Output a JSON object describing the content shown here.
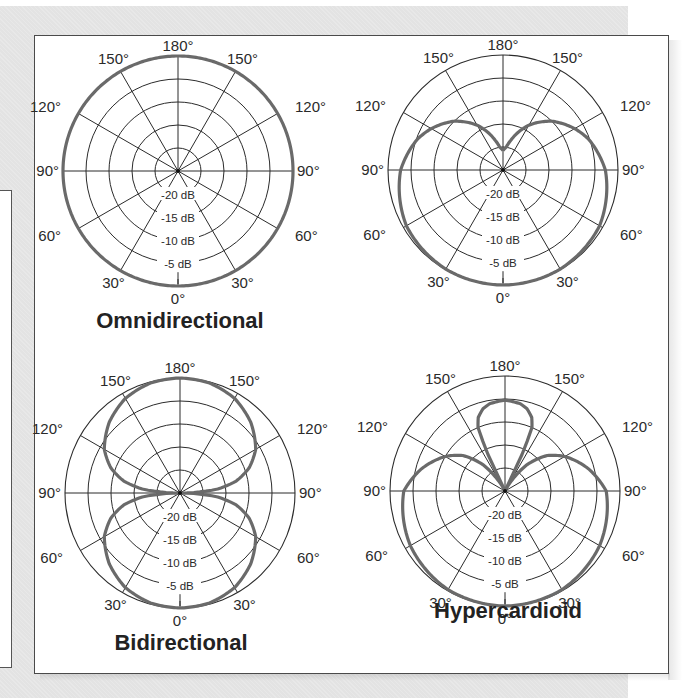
{
  "figure": {
    "plots": [
      {
        "id": "omni",
        "title": "Omnidirectional",
        "cx": 178,
        "cy": 171,
        "title_x": 180,
        "title_y": 328
      },
      {
        "id": "cardioid",
        "title": "",
        "cx": 503,
        "cy": 170,
        "title_x": 505,
        "title_y": 328
      },
      {
        "id": "bidirectional",
        "title": "Bidirectional",
        "cx": 180,
        "cy": 493,
        "title_x": 181,
        "title_y": 650
      },
      {
        "id": "hypercardioid",
        "title": "Hypercardioid",
        "cx": 505,
        "cy": 491,
        "title_x": 508,
        "title_y": 618
      }
    ],
    "radius": 115,
    "angle_labels": [
      "180°",
      "150°",
      "150°",
      "120°",
      "120°",
      "90°",
      "90°",
      "60°",
      "60°",
      "30°",
      "30°",
      "0°"
    ],
    "ring_labels": [
      "-20 dB",
      "-15 dB",
      "-10 dB",
      "-5 dB"
    ],
    "colors": {
      "grid": "#2b2b2b",
      "pattern": "#6a6a6a",
      "panel_border": "#4a4a4a",
      "background": "#e3e3e3"
    }
  },
  "chart_data": [
    {
      "type": "polar",
      "title": "Omnidirectional",
      "angle_unit": "degrees (0° = front/bottom, 180° = rear/top), symmetric left/right",
      "angles": [
        0,
        30,
        60,
        90,
        120,
        150,
        180
      ],
      "radial_ticks": [
        "-20 dB",
        "-15 dB",
        "-10 dB",
        "-5 dB",
        "0 dB"
      ],
      "values_db": [
        0,
        0,
        0,
        0,
        0,
        0,
        0
      ],
      "r_fraction": [
        [
          0,
          1.0
        ],
        [
          180,
          1.0
        ]
      ]
    },
    {
      "type": "polar",
      "title": "Cardioid",
      "angles": [
        0,
        30,
        60,
        90,
        120,
        150,
        180
      ],
      "radial_ticks": [
        "-20 dB",
        "-15 dB",
        "-10 dB",
        "-5 dB",
        "0 dB"
      ],
      "values_db": [
        0,
        0,
        -1,
        -2.5,
        -6,
        -12,
        -21
      ],
      "r_fraction": [
        [
          0,
          1.0
        ],
        [
          30,
          0.995
        ],
        [
          60,
          0.97
        ],
        [
          90,
          0.89
        ],
        [
          110,
          0.79
        ],
        [
          120,
          0.72
        ],
        [
          135,
          0.6
        ],
        [
          150,
          0.45
        ],
        [
          165,
          0.27
        ],
        [
          172,
          0.2
        ],
        [
          180,
          0.17
        ]
      ]
    },
    {
      "type": "polar",
      "title": "Bidirectional",
      "angles": [
        0,
        30,
        60,
        90,
        120,
        150,
        180
      ],
      "radial_ticks": [
        "-20 dB",
        "-15 dB",
        "-10 dB",
        "-5 dB",
        "0 dB"
      ],
      "values_db": [
        0,
        -1.2,
        -6,
        -25,
        -6,
        -1.2,
        0
      ],
      "r_fraction": [
        [
          0,
          1.0
        ],
        [
          15,
          0.99
        ],
        [
          30,
          0.95
        ],
        [
          45,
          0.87
        ],
        [
          60,
          0.76
        ],
        [
          70,
          0.64
        ],
        [
          78,
          0.5
        ],
        [
          84,
          0.33
        ],
        [
          88,
          0.12
        ],
        [
          90,
          0.0
        ],
        [
          92,
          0.12
        ],
        [
          96,
          0.33
        ],
        [
          102,
          0.5
        ],
        [
          110,
          0.64
        ],
        [
          120,
          0.76
        ],
        [
          135,
          0.87
        ],
        [
          150,
          0.95
        ],
        [
          165,
          0.99
        ],
        [
          180,
          1.0
        ]
      ]
    },
    {
      "type": "polar",
      "title": "Hypercardioid",
      "angles": [
        0,
        30,
        60,
        90,
        120,
        150,
        180
      ],
      "radial_ticks": [
        "-20 dB",
        "-15 dB",
        "-10 dB",
        "-5 dB",
        "0 dB"
      ],
      "values_db": [
        0,
        -0.2,
        -1,
        -2.5,
        -9,
        -25,
        -5
      ],
      "r_fraction": [
        [
          0,
          1.0
        ],
        [
          30,
          0.99
        ],
        [
          60,
          0.95
        ],
        [
          90,
          0.88
        ],
        [
          105,
          0.75
        ],
        [
          120,
          0.6
        ],
        [
          130,
          0.48
        ],
        [
          140,
          0.3
        ],
        [
          147,
          0.12
        ],
        [
          152,
          0.0
        ],
        [
          154,
          0.0
        ],
        [
          155,
          0.35
        ],
        [
          157,
          0.6
        ],
        [
          160,
          0.68
        ],
        [
          165,
          0.74
        ],
        [
          170,
          0.77
        ],
        [
          180,
          0.79
        ]
      ]
    }
  ]
}
